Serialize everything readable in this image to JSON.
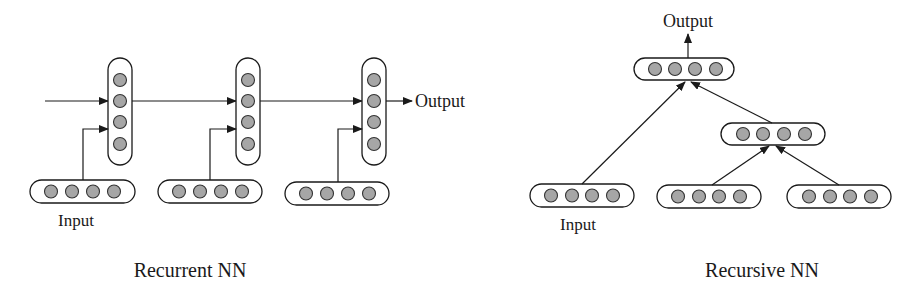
{
  "colors": {
    "background": "#ffffff",
    "stroke": "#1a1a1a",
    "node_fill": "#a6a6a6"
  },
  "recurrent": {
    "caption": "Recurrent NN",
    "input_label": "Input",
    "output_label": "Output",
    "steps": 3,
    "nodes_per_layer": 4
  },
  "recursive": {
    "caption": "Recursive NN",
    "input_label": "Input",
    "output_label": "Output",
    "leaves": 3,
    "nodes_per_layer": 4
  }
}
